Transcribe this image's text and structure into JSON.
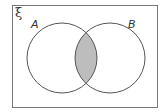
{
  "diagram": {
    "type": "venn",
    "universal_set_label": "ξ",
    "sets": [
      {
        "label": "A"
      },
      {
        "label": "B"
      }
    ],
    "shaded_region": "A ∩ B",
    "colors": {
      "stroke": "#555555",
      "frame": "#777777",
      "shade": "#bdbdbd",
      "background": "#ffffff"
    }
  }
}
